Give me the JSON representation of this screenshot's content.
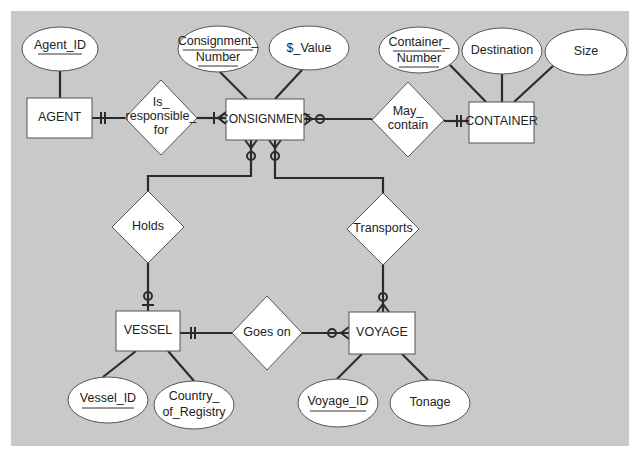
{
  "diagram": {
    "type": "entity-relationship",
    "notation": "crow's foot",
    "background_color": "#c9c9c9",
    "entities": [
      {
        "id": "agent",
        "name": "AGENT"
      },
      {
        "id": "consignment",
        "name": "CONSIGNMENT"
      },
      {
        "id": "container",
        "name": "CONTAINER"
      },
      {
        "id": "vessel",
        "name": "VESSEL"
      },
      {
        "id": "voyage",
        "name": "VOYAGE"
      }
    ],
    "relationships": [
      {
        "id": "is_responsible_for",
        "lines": [
          "Is_",
          "responsible_",
          "for"
        ],
        "from": "AGENT",
        "to": "CONSIGNMENT",
        "from_card": "one and only one",
        "to_card": "one or many"
      },
      {
        "id": "may_contain",
        "lines": [
          "May_",
          "contain"
        ],
        "from": "CONSIGNMENT",
        "to": "CONTAINER",
        "from_card": "zero or many",
        "to_card": "one and only one"
      },
      {
        "id": "holds",
        "lines": [
          "Holds"
        ],
        "from": "CONSIGNMENT",
        "to": "VESSEL",
        "from_card": "zero or many",
        "to_card": "zero or one"
      },
      {
        "id": "transports",
        "lines": [
          "Transports"
        ],
        "from": "CONSIGNMENT",
        "to": "VOYAGE",
        "from_card": "zero or many",
        "to_card": "zero or many"
      },
      {
        "id": "goes_on",
        "lines": [
          "Goes on"
        ],
        "from": "VESSEL",
        "to": "VOYAGE",
        "from_card": "one and only one",
        "to_card": "zero or many"
      }
    ],
    "attributes": {
      "agent_id": {
        "lines": [
          "Agent_ID"
        ],
        "key": true,
        "entity": "AGENT"
      },
      "consignment_number": {
        "lines": [
          "Consignment_",
          "Number"
        ],
        "key": true,
        "entity": "CONSIGNMENT"
      },
      "value": {
        "lines": [
          "$_Value"
        ],
        "key": false,
        "entity": "CONSIGNMENT"
      },
      "container_number": {
        "lines": [
          "Container_",
          "Number"
        ],
        "key": true,
        "entity": "CONTAINER"
      },
      "destination": {
        "lines": [
          "Destination"
        ],
        "key": false,
        "entity": "CONTAINER"
      },
      "size": {
        "lines": [
          "Size"
        ],
        "key": false,
        "entity": "CONTAINER"
      },
      "vessel_id": {
        "lines": [
          "Vessel_ID"
        ],
        "key": true,
        "entity": "VESSEL"
      },
      "country_of_registry": {
        "lines": [
          "Country_",
          "of_Registry"
        ],
        "key": false,
        "entity": "VESSEL"
      },
      "voyage_id": {
        "lines": [
          "Voyage_ID"
        ],
        "key": true,
        "entity": "VOYAGE"
      },
      "tonage": {
        "lines": [
          "Tonage"
        ],
        "key": false,
        "entity": "VOYAGE"
      }
    }
  }
}
